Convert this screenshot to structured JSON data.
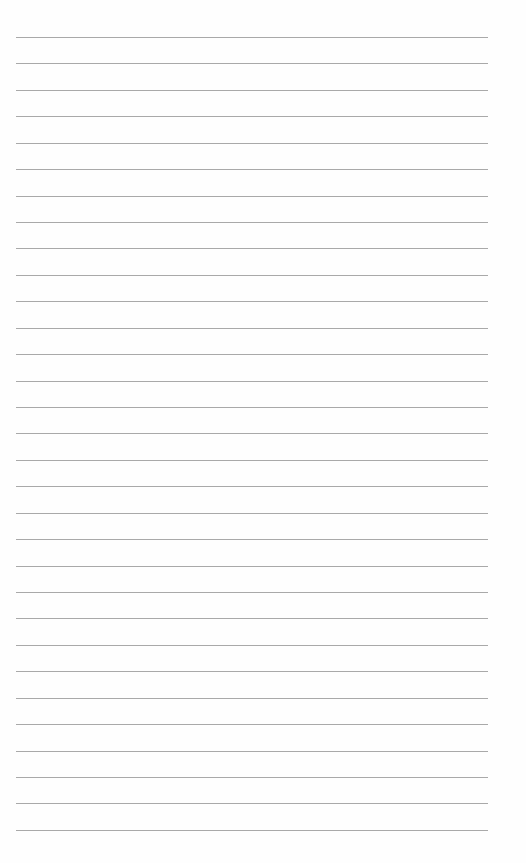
{
  "page": {
    "type": "blank lined sheet",
    "line_count": 31,
    "first_line_y": 37,
    "line_spacing": 26.43,
    "line_left": 16,
    "line_width": 472,
    "line_color": "#a9a9a9",
    "background_color": "#fefefe"
  }
}
